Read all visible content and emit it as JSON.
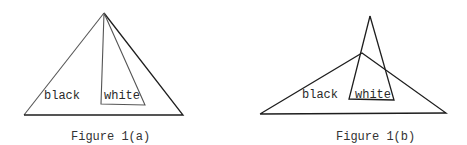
{
  "figures": [
    {
      "id": "1a",
      "caption": "Figure 1(a)",
      "labels": {
        "black": "black",
        "white": "white"
      },
      "outer_triangle": {
        "apex": [
          104,
          13
        ],
        "base_left": [
          24,
          115
        ],
        "base_right": [
          183,
          115
        ]
      },
      "white_region": {
        "apex": [
          104,
          13
        ],
        "bottom_left": [
          101,
          104
        ],
        "bottom_right": [
          145,
          105
        ]
      }
    },
    {
      "id": "1b",
      "caption": "Figure 1(b)",
      "labels": {
        "black": "black",
        "white": "white"
      },
      "outer_triangle": {
        "apex": [
          362,
          53
        ],
        "base_left": [
          260,
          114
        ],
        "base_right": [
          446,
          113
        ]
      },
      "white_region": {
        "apex": [
          370,
          16
        ],
        "bottom_left": [
          349,
          99
        ],
        "bottom_right": [
          394,
          100
        ]
      }
    }
  ],
  "colors": {
    "line": "#1e1e1e",
    "text": "#2a2a2a",
    "background": "#ffffff"
  }
}
